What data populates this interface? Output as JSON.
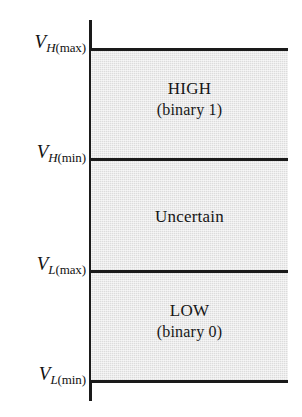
{
  "figure": {
    "type": "region-diagram",
    "axis_color": "#1a1a1a",
    "band_fill_color": "#dcdcdc",
    "background_color": "#ffffff"
  },
  "axis": {
    "name": "voltage-axis",
    "orientation": "vertical",
    "labels": [
      {
        "id": "vh-max",
        "symbol": "V",
        "sub_letter": "H",
        "sub_qualifier": "(max)",
        "full_text": "VH(max)"
      },
      {
        "id": "vh-min",
        "symbol": "V",
        "sub_letter": "H",
        "sub_qualifier": "(min)",
        "full_text": "VH(min)"
      },
      {
        "id": "vl-max",
        "symbol": "V",
        "sub_letter": "L",
        "sub_qualifier": "(max)",
        "full_text": "VL(max)"
      },
      {
        "id": "vl-min",
        "symbol": "V",
        "sub_letter": "L",
        "sub_qualifier": "(min)",
        "full_text": "VL(min)"
      }
    ]
  },
  "bands": [
    {
      "id": "high",
      "title": "HIGH",
      "subtitle": "(binary 1)",
      "upper_bound": "VH(max)",
      "lower_bound": "VH(min)"
    },
    {
      "id": "uncertain",
      "title": "Uncertain",
      "subtitle": "",
      "upper_bound": "VH(min)",
      "lower_bound": "VL(max)"
    },
    {
      "id": "low",
      "title": "LOW",
      "subtitle": "(binary 0)",
      "upper_bound": "VL(max)",
      "lower_bound": "VL(min)"
    }
  ],
  "chart_data": {
    "type": "bar",
    "xlabel": "",
    "ylabel": "",
    "orientation": "vertical-bands",
    "categories": [
      "LOW (binary 0)",
      "Uncertain",
      "HIGH (binary 1)"
    ],
    "boundaries": [
      "VL(min)",
      "VL(max)",
      "VH(min)",
      "VH(max)"
    ],
    "values": [
      1,
      1,
      1
    ],
    "legend": []
  }
}
